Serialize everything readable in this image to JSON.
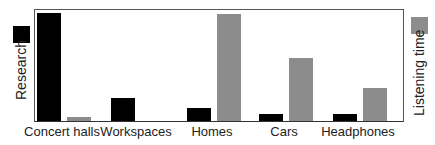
{
  "chart_data": {
    "type": "bar",
    "title": "",
    "xlabel": "",
    "ylabel_left": "Research",
    "ylabel_right": "Listening time",
    "categories": [
      "Concert halls",
      "Workspaces",
      "Homes",
      "Cars",
      "Headphones"
    ],
    "series": [
      {
        "name": "Research",
        "color": "#000000",
        "values": [
          97,
          21,
          12,
          6,
          6
        ]
      },
      {
        "name": "Listening time",
        "color": "#8c8c8c",
        "values": [
          4,
          0,
          96,
          57,
          30
        ]
      }
    ],
    "ylim": [
      0,
      100
    ],
    "grid": false,
    "axis_ticks": false,
    "legend_position": "left swatch for Research, right swatch for Listening time"
  },
  "legend": {
    "left_label": "Research",
    "right_label": "Listening time"
  }
}
